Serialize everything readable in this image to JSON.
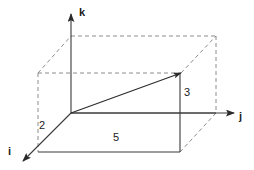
{
  "figure": {
    "background_color": "#ffffff",
    "solid_line_color": "#3a3a3a",
    "dashed_line_color": "#8c8c8c",
    "text_color": "#1b1b1b"
  },
  "axes": [
    {
      "id": "k",
      "label": "k",
      "direction": "up",
      "label_x": 79,
      "label_y": 16
    },
    {
      "id": "j",
      "label": "j",
      "direction": "right",
      "label_x": 239,
      "label_y": 120
    },
    {
      "id": "i",
      "label": "i",
      "direction": "down-left",
      "label_x": 8,
      "label_y": 155
    }
  ],
  "measurements": [
    {
      "id": "i-component",
      "value": "2",
      "label_x": 42,
      "label_y": 129
    },
    {
      "id": "k-component",
      "value": "3",
      "label_x": 184,
      "label_y": 96
    },
    {
      "id": "j-component",
      "value": "5",
      "label_x": 113,
      "label_y": 141
    }
  ],
  "vector": {
    "id": "resultant-vector",
    "from": {
      "x": 71,
      "y": 113
    },
    "to": {
      "x": 181,
      "y": 73
    },
    "components": {
      "i": 2,
      "j": 5,
      "k": 3
    }
  },
  "origin": {
    "x": 71,
    "y": 113
  }
}
